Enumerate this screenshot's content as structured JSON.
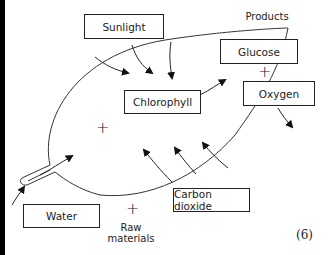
{
  "diagram": {
    "inputs": {
      "sunlight": "Sunlight",
      "water": "Water",
      "carbon_dioxide": "Carbon dioxide",
      "raw_materials_label": "Raw\nmaterials"
    },
    "center": {
      "chlorophyll": "Chlorophyll"
    },
    "outputs": {
      "heading": "Products",
      "glucose": "Glucose",
      "oxygen": "Oxygen"
    },
    "symbols": {
      "plus": "+"
    },
    "question_marks": "(6)"
  }
}
